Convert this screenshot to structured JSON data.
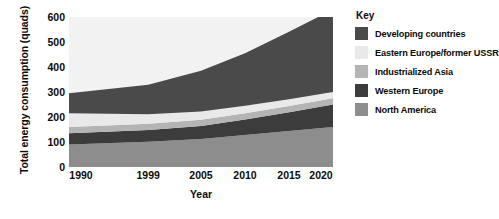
{
  "chart_data": {
    "type": "area",
    "stacked": true,
    "title": "",
    "xlabel": "Year",
    "ylabel": "Total energy consumption (quads)",
    "x": [
      1990,
      1999,
      2005,
      2010,
      2015,
      2020
    ],
    "xtick_labels": [
      "1990",
      "1999",
      "2005",
      "2010",
      "2015",
      "2020"
    ],
    "ytick_labels": [
      "0",
      "100",
      "200",
      "300",
      "400",
      "500",
      "600"
    ],
    "yticks": [
      0,
      100,
      200,
      300,
      400,
      500,
      600
    ],
    "ylim": [
      0,
      600
    ],
    "xlim": [
      1990,
      2020
    ],
    "grid": false,
    "legend_position": "right",
    "legend_title": "Key",
    "series": [
      {
        "name": "North America",
        "color": "#8d8d8d",
        "values": [
          90,
          101,
          112,
          128,
          144,
          160
        ]
      },
      {
        "name": "Western Europe",
        "color": "#3c3c3c",
        "values": [
          45,
          47,
          52,
          62,
          75,
          90
        ]
      },
      {
        "name": "Industrialized Asia",
        "color": "#b4b4b4",
        "values": [
          25,
          25,
          25,
          25,
          25,
          25
        ]
      },
      {
        "name": "Eastern Europe/former USSR",
        "color": "#e9e9e9",
        "values": [
          55,
          38,
          33,
          30,
          27,
          25
        ]
      },
      {
        "name": "Developing countries",
        "color": "#4a4a4a",
        "values": [
          80,
          118,
          163,
          210,
          270,
          330
        ]
      }
    ],
    "stack_order_bottom_to_top": [
      "North America",
      "Western Europe",
      "Industrialized Asia",
      "Eastern Europe/former USSR",
      "Developing countries"
    ],
    "cumulative_totals": [
      295,
      329,
      385,
      455,
      541,
      630
    ],
    "plot_background": "#f2f2f2"
  },
  "legend": {
    "title": "Key",
    "items": [
      {
        "label": "Developing countries",
        "color": "#4a4a4a"
      },
      {
        "label": "Eastern Europe/former USSR",
        "color": "#e9e9e9"
      },
      {
        "label": "Industrialized Asia",
        "color": "#b4b4b4"
      },
      {
        "label": "Western Europe",
        "color": "#3c3c3c"
      },
      {
        "label": "North America",
        "color": "#8d8d8d"
      }
    ]
  }
}
